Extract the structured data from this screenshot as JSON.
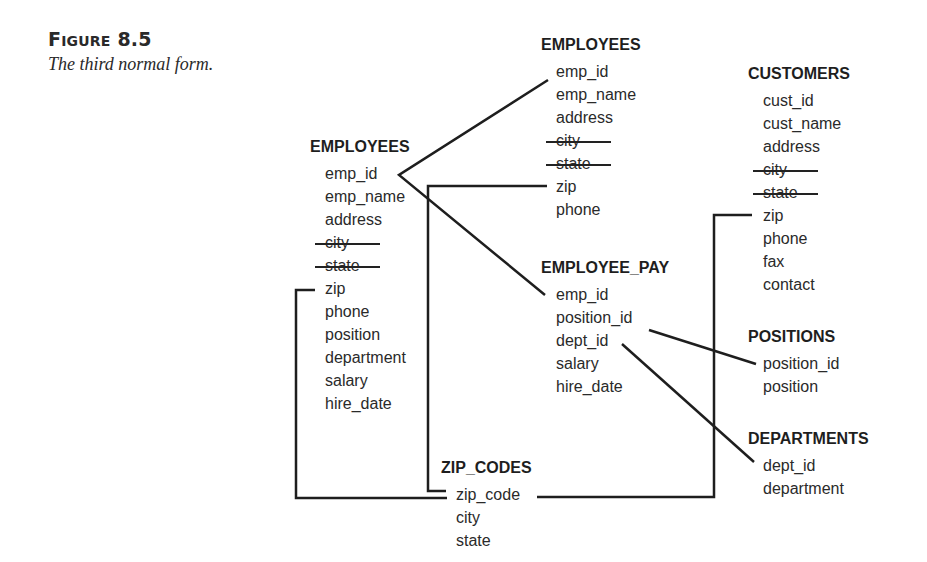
{
  "figure": {
    "label_prefix": "F",
    "label_smallcaps": "IGURE",
    "label_number": "8.5",
    "caption": "The third normal form."
  },
  "tables": {
    "employees_original": {
      "title": "EMPLOYEES",
      "fields": [
        {
          "name": "emp_id",
          "removed": false
        },
        {
          "name": "emp_name",
          "removed": false
        },
        {
          "name": "address",
          "removed": false
        },
        {
          "name": "city",
          "removed": true
        },
        {
          "name": "state",
          "removed": true
        },
        {
          "name": "zip",
          "removed": false
        },
        {
          "name": "phone",
          "removed": false
        },
        {
          "name": "position",
          "removed": false
        },
        {
          "name": "department",
          "removed": false
        },
        {
          "name": "salary",
          "removed": false
        },
        {
          "name": "hire_date",
          "removed": false
        }
      ]
    },
    "employees": {
      "title": "EMPLOYEES",
      "fields": [
        {
          "name": "emp_id",
          "removed": false
        },
        {
          "name": "emp_name",
          "removed": false
        },
        {
          "name": "address",
          "removed": false
        },
        {
          "name": "city",
          "removed": true
        },
        {
          "name": "state",
          "removed": true
        },
        {
          "name": "zip",
          "removed": false
        },
        {
          "name": "phone",
          "removed": false
        }
      ]
    },
    "employee_pay": {
      "title": "EMPLOYEE_PAY",
      "fields": [
        {
          "name": "emp_id",
          "removed": false
        },
        {
          "name": "position_id",
          "removed": false
        },
        {
          "name": "dept_id",
          "removed": false
        },
        {
          "name": "salary",
          "removed": false
        },
        {
          "name": "hire_date",
          "removed": false
        }
      ]
    },
    "customers": {
      "title": "CUSTOMERS",
      "fields": [
        {
          "name": "cust_id",
          "removed": false
        },
        {
          "name": "cust_name",
          "removed": false
        },
        {
          "name": "address",
          "removed": false
        },
        {
          "name": "city",
          "removed": true
        },
        {
          "name": "state",
          "removed": true
        },
        {
          "name": "zip",
          "removed": false
        },
        {
          "name": "phone",
          "removed": false
        },
        {
          "name": "fax",
          "removed": false
        },
        {
          "name": "contact",
          "removed": false
        }
      ]
    },
    "positions": {
      "title": "POSITIONS",
      "fields": [
        {
          "name": "position_id",
          "removed": false
        },
        {
          "name": "position",
          "removed": false
        }
      ]
    },
    "departments": {
      "title": "DEPARTMENTS",
      "fields": [
        {
          "name": "dept_id",
          "removed": false
        },
        {
          "name": "department",
          "removed": false
        }
      ]
    },
    "zip_codes": {
      "title": "ZIP_CODES",
      "fields": [
        {
          "name": "zip_code",
          "removed": false
        },
        {
          "name": "city",
          "removed": false
        },
        {
          "name": "state",
          "removed": false
        }
      ]
    }
  },
  "relationships": [
    {
      "from": "EMPLOYEES(original).emp_id",
      "to": "EMPLOYEES.emp_id"
    },
    {
      "from": "EMPLOYEES(original).emp_id",
      "to": "EMPLOYEE_PAY.emp_id"
    },
    {
      "from": "EMPLOYEES(original).zip",
      "to": "ZIP_CODES.zip_code"
    },
    {
      "from": "EMPLOYEES.zip",
      "to": "ZIP_CODES.zip_code"
    },
    {
      "from": "CUSTOMERS.zip",
      "to": "ZIP_CODES.zip_code"
    },
    {
      "from": "EMPLOYEE_PAY.position_id",
      "to": "POSITIONS.position_id"
    },
    {
      "from": "EMPLOYEE_PAY.dept_id",
      "to": "DEPARTMENTS.dept_id"
    }
  ],
  "colors": {
    "line": "#1e1e1e",
    "text": "#2a2a2a"
  }
}
